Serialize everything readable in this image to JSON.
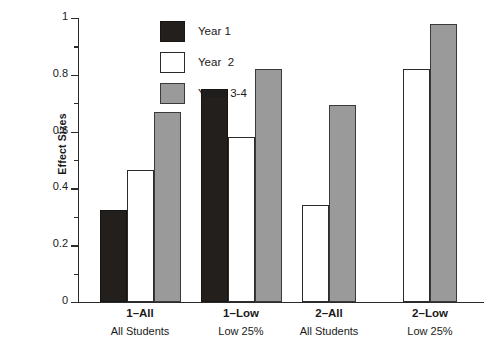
{
  "chart_data": {
    "type": "bar",
    "title": "",
    "xlabel": "",
    "ylabel": "Effect Sizes",
    "ylim": [
      0,
      1
    ],
    "yticks": [
      0,
      0.2,
      0.4,
      0.6,
      0.8,
      1
    ],
    "ytick_labels": [
      "0",
      "0.2",
      "0.4",
      "0.6",
      "0.8",
      "1"
    ],
    "yminor_ticks": [
      0.1,
      0.3,
      0.5,
      0.7,
      0.9
    ],
    "grid": false,
    "legend_position": "upper left (inside plot)",
    "categories": [
      "1–All",
      "1–Low",
      "2–All",
      "2–Low"
    ],
    "category_sublabels": [
      "All Students",
      "Low 25%",
      "All Students",
      "Low 25%"
    ],
    "series": [
      {
        "name": "Year 1",
        "color": "#231f1c",
        "values": [
          0.325,
          0.75,
          null,
          null
        ]
      },
      {
        "name": "Year  2",
        "color": "#ffffff",
        "values": [
          0.465,
          0.58,
          0.34,
          0.82
        ]
      },
      {
        "name": "Years 3-4",
        "color": "#9a9a9a",
        "values": [
          0.67,
          0.82,
          0.695,
          0.98
        ]
      }
    ]
  },
  "axis": {
    "y_title": "Effect Sizes",
    "tick_0": "0",
    "tick_1": "0.2",
    "tick_2": "0.4",
    "tick_3": "0.6",
    "tick_4": "0.8",
    "tick_5": "1"
  },
  "legend": {
    "items": [
      {
        "label": "Year 1",
        "swatch": "black-square-icon"
      },
      {
        "label": "Year  2",
        "swatch": "white-square-icon"
      },
      {
        "label": "Years 3-4",
        "swatch": "gray-square-icon"
      }
    ]
  },
  "categories": [
    {
      "primary": "1–All",
      "secondary": "All Students"
    },
    {
      "primary": "1–Low",
      "secondary": "Low 25%"
    },
    {
      "primary": "2–All",
      "secondary": "All Students"
    },
    {
      "primary": "2–Low",
      "secondary": "Low 25%"
    }
  ]
}
